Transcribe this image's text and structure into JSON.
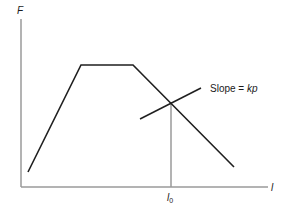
{
  "diagram": {
    "y_axis_label": "F",
    "x_axis_label": "l",
    "x_marker_label_main": "l",
    "x_marker_label_sub": "0",
    "slope_label_prefix": "Slope = ",
    "slope_label_value": "kp",
    "colors": {
      "axis": "#9a9a9a",
      "curve": "#1f1f1f",
      "text": "#1a1a1a"
    },
    "curve_points": [
      [
        28,
        172
      ],
      [
        81,
        65
      ],
      [
        133,
        65
      ],
      [
        234,
        167
      ]
    ],
    "tangent_line": [
      [
        140,
        119
      ],
      [
        201,
        88
      ]
    ],
    "marker_x": 171
  }
}
